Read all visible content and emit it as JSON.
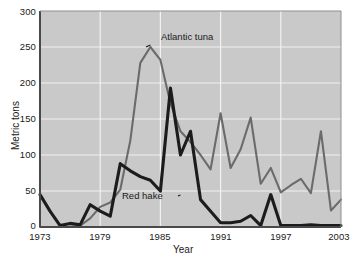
{
  "chart_data": {
    "type": "line",
    "title": "",
    "xlabel": "Year",
    "ylabel": "Metric tons",
    "xlim": [
      1973,
      2003
    ],
    "ylim": [
      0,
      300
    ],
    "grid": true,
    "legend_position": "inline-annotation",
    "xticks": [
      1973,
      1979,
      1985,
      1991,
      1997,
      2003
    ],
    "yticks": [
      0,
      50,
      100,
      150,
      200,
      250,
      300
    ],
    "x": [
      1973,
      1974,
      1975,
      1976,
      1977,
      1978,
      1979,
      1980,
      1981,
      1982,
      1983,
      1984,
      1985,
      1986,
      1987,
      1988,
      1989,
      1990,
      1991,
      1992,
      1993,
      1994,
      1995,
      1996,
      1997,
      1998,
      1999,
      2000,
      2001,
      2002,
      2003
    ],
    "series": [
      {
        "name": "Atlantic tuna",
        "color": "#6b6b6b",
        "values": [
          0,
          0,
          0,
          0,
          2,
          12,
          28,
          34,
          52,
          120,
          228,
          250,
          232,
          172,
          133,
          118,
          100,
          80,
          158,
          82,
          108,
          152,
          60,
          82,
          48,
          58,
          67,
          47,
          133,
          23,
          38
        ]
      },
      {
        "name": "Red hake",
        "color": "#1c1c1c",
        "values": [
          45,
          22,
          2,
          5,
          3,
          31,
          22,
          15,
          88,
          78,
          70,
          65,
          50,
          193,
          100,
          133,
          38,
          22,
          6,
          6,
          8,
          16,
          2,
          45,
          2,
          2,
          2,
          3,
          2,
          2,
          2
        ]
      }
    ],
    "annotations": [
      {
        "text": "Atlantic tuna",
        "target_year": 1984,
        "target_value": 250
      },
      {
        "text": "Red hake",
        "target_year": 1987,
        "target_value": 100
      }
    ]
  },
  "axis": {
    "ytick_labels": [
      "300",
      "250",
      "200",
      "150",
      "100",
      "50",
      "0"
    ],
    "xtick_labels": [
      "1973",
      "1979",
      "1985",
      "1991",
      "1997",
      "2003"
    ],
    "ylabel_text": "Metric tons",
    "xlabel_text": "Year"
  },
  "annotations": {
    "tuna_label": "Atlantic tuna",
    "hake_label": "Red hake"
  },
  "colors": {
    "plot_background": "#c9c9c9",
    "gridline": "#f2f2f2",
    "axis_line": "#4a4a4a",
    "tuna_line": "#6b6b6b",
    "hake_line": "#1c1c1c",
    "text": "#1a1a1a"
  }
}
